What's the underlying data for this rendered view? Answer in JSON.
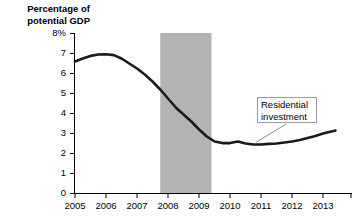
{
  "chart_data": {
    "type": "line",
    "title": "",
    "subtitle": "",
    "ylabel": "Percentage of\npotential GDP",
    "xlabel": "",
    "ylim": [
      0,
      8
    ],
    "xlim": [
      2005,
      2013.5
    ],
    "grid": false,
    "legend_position": "none",
    "y_ticks": [
      "8%",
      "7",
      "6",
      "5",
      "4",
      "3",
      "2",
      "1",
      "0"
    ],
    "y_tick_values": [
      8,
      7,
      6,
      5,
      4,
      3,
      2,
      1,
      0
    ],
    "x_ticks": [
      "2005",
      "2006",
      "2007",
      "2008",
      "2009",
      "2010",
      "2011",
      "2012",
      "2013"
    ],
    "x_tick_values": [
      2005,
      2006,
      2007,
      2008,
      2009,
      2010,
      2011,
      2012,
      2013
    ],
    "series": [
      {
        "name": "Residential investment",
        "color": "#1a1a1a",
        "x": [
          2005.0,
          2005.25,
          2005.5,
          2005.75,
          2006.0,
          2006.25,
          2006.5,
          2006.75,
          2007.0,
          2007.25,
          2007.5,
          2007.75,
          2008.0,
          2008.25,
          2008.5,
          2008.75,
          2009.0,
          2009.25,
          2009.5,
          2009.75,
          2010.0,
          2010.25,
          2010.5,
          2010.75,
          2011.0,
          2011.25,
          2011.5,
          2011.75,
          2012.0,
          2012.25,
          2012.5,
          2012.75,
          2013.0,
          2013.4
        ],
        "values": [
          6.6,
          6.75,
          6.88,
          6.95,
          6.96,
          6.92,
          6.75,
          6.5,
          6.25,
          5.95,
          5.6,
          5.2,
          4.75,
          4.3,
          3.95,
          3.6,
          3.2,
          2.85,
          2.6,
          2.52,
          2.52,
          2.6,
          2.5,
          2.45,
          2.45,
          2.48,
          2.5,
          2.55,
          2.6,
          2.68,
          2.78,
          2.88,
          3.0,
          3.15
        ]
      }
    ],
    "shaded_regions": [
      {
        "name": "recession-band",
        "x_start": 2007.75,
        "x_end": 2009.4,
        "color": "#b3b3b3"
      }
    ],
    "annotations": [
      {
        "name": "residential-investment-label",
        "text": "Residential\ninvestment",
        "box_color": "#ffffff",
        "border_color": "#9a9a9a",
        "leader_to_x": 2010.85,
        "leader_to_y": 2.47
      }
    ]
  }
}
